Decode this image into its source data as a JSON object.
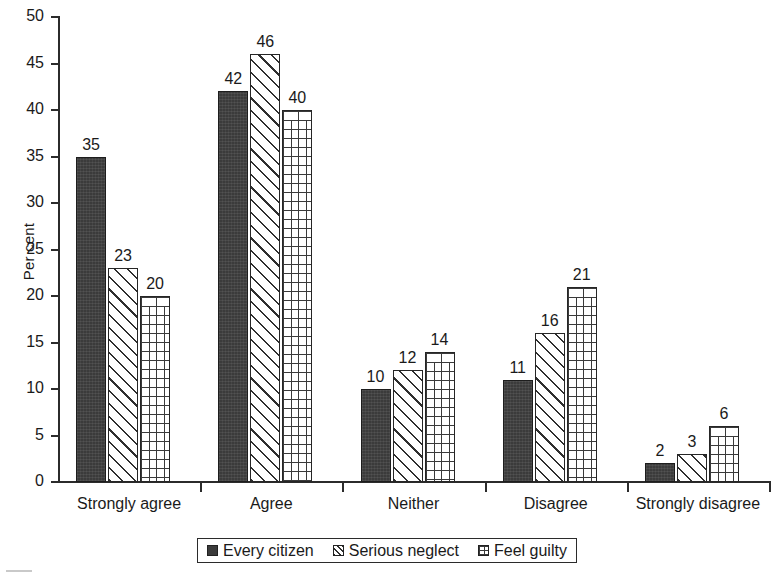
{
  "chart_data": {
    "type": "bar",
    "title": "",
    "subtitle": "",
    "xlabel": "",
    "ylabel": "Per cent",
    "ylim": [
      0,
      50
    ],
    "ytick_step": 5,
    "yticks": [
      "0",
      "5",
      "10",
      "15",
      "20",
      "25",
      "30",
      "35",
      "40",
      "45",
      "50"
    ],
    "grid": false,
    "legend_position": "bottom",
    "categories": [
      "Strongly agree",
      "Agree",
      "Neither",
      "Disagree",
      "Strongly disagree"
    ],
    "series": [
      {
        "name": "Every citizen",
        "pattern": "solid-dark",
        "values": [
          35,
          42,
          10,
          11,
          2
        ]
      },
      {
        "name": "Serious neglect",
        "pattern": "diagonal-hatch",
        "values": [
          23,
          46,
          12,
          16,
          3
        ]
      },
      {
        "name": "Feel guilty",
        "pattern": "brick",
        "values": [
          20,
          40,
          14,
          21,
          6
        ]
      }
    ],
    "colors": {
      "series_every_citizen": "#3b3b3b",
      "series_serious_neglect": "#ffffff",
      "series_feel_guilty": "#ffffff",
      "axis": "#2b2b2b",
      "text": "#1a1a1a",
      "background": "#ffffff"
    }
  },
  "legend": {
    "items": [
      {
        "label": "Every citizen"
      },
      {
        "label": "Serious neglect"
      },
      {
        "label": "Feel guilty"
      }
    ]
  }
}
